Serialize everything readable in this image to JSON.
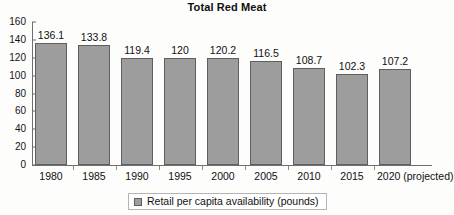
{
  "chart_data": {
    "type": "bar",
    "title": "Total Red Meat",
    "xlabel": "",
    "ylabel": "",
    "categories": [
      "1980",
      "1985",
      "1990",
      "1995",
      "2000",
      "2005",
      "2010",
      "2015",
      "2020 (projected)"
    ],
    "values": [
      136.1,
      133.8,
      119.4,
      120,
      120.2,
      116.5,
      108.7,
      102.3,
      107.2
    ],
    "value_labels": [
      "136.1",
      "133.8",
      "119.4",
      "120",
      "120.2",
      "116.5",
      "108.7",
      "102.3",
      "107.2"
    ],
    "series": [
      {
        "name": "Retail per capita availability (pounds)",
        "values": [
          136.1,
          133.8,
          119.4,
          120,
          120.2,
          116.5,
          108.7,
          102.3,
          107.2
        ],
        "color": "#9d9d9d"
      }
    ],
    "ylim": [
      0,
      160
    ],
    "yticks": [
      0,
      20,
      40,
      60,
      80,
      100,
      120,
      140,
      160
    ],
    "ytick_labels": [
      "0",
      "20",
      "40",
      "60",
      "80",
      "100",
      "120",
      "140",
      "160"
    ],
    "grid": false,
    "legend": {
      "position": "bottom",
      "entries": [
        {
          "label": "Retail per capita availability (pounds)",
          "color": "#9d9d9d"
        }
      ]
    },
    "colors": {
      "bar_fill": "#9d9d9d",
      "bar_stroke": "#5f5f5f",
      "axis": "#6f6f6f",
      "text": "#101010",
      "background": "#fdfdfc"
    }
  }
}
